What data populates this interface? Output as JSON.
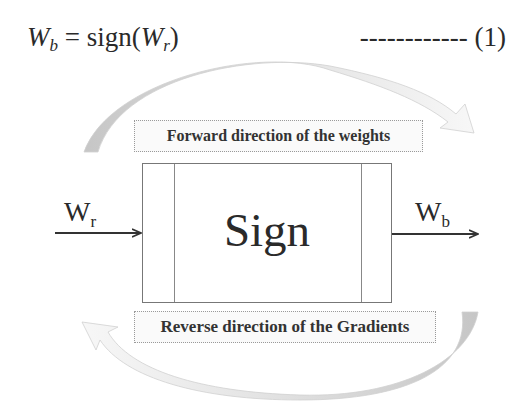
{
  "equation": {
    "lhs_var": "W",
    "lhs_sub": "b",
    "equals": " = ",
    "func": "sign(",
    "arg_var": "W",
    "arg_sub": "r",
    "close": ")",
    "number": "------------ (1)"
  },
  "diagram": {
    "forward_label": "Forward direction of the weights",
    "reverse_label": "Reverse direction of the Gradients",
    "block_label": "Sign",
    "input": {
      "var": "W",
      "sub": "r"
    },
    "output": {
      "var": "W",
      "sub": "b"
    }
  },
  "colors": {
    "arc_dark": "#c8c8c8",
    "arc_light": "#eeeeee",
    "line": "#333333"
  }
}
